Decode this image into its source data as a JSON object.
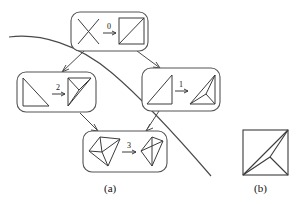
{
  "figure": {
    "caption_a": "(a)",
    "caption_b": "(b)",
    "stroke_color": "#3b3b3b",
    "node_border_color": "#555555",
    "curve_color": "#4a4a4a",
    "background": "#ffffff"
  },
  "panel_a": {
    "name": "flip-graph-tree",
    "nodes": [
      {
        "id": "node-0",
        "label": "0",
        "position": "top",
        "left_shape": "crossing-segments-x",
        "right_shape": "square-with-diagonal",
        "arrow_label": "0"
      },
      {
        "id": "node-2",
        "label": "2",
        "position": "middle-left",
        "left_shape": "triangle-lower-left",
        "right_shape": "triangle-with-interior-point",
        "arrow_label": "2"
      },
      {
        "id": "node-1",
        "label": "1",
        "position": "middle-right",
        "left_shape": "triangle-right",
        "right_shape": "triangle-with-interior-point",
        "arrow_label": "1"
      },
      {
        "id": "node-3",
        "label": "3",
        "position": "bottom",
        "left_shape": "quadrilateral-with-interior-point",
        "right_shape": "quadrilateral-with-both-diagonals",
        "arrow_label": "3"
      }
    ],
    "edges": [
      {
        "from": "node-0",
        "to": "node-2"
      },
      {
        "from": "node-0",
        "to": "node-1"
      },
      {
        "from": "node-2",
        "to": "node-3"
      },
      {
        "from": "node-1",
        "to": "node-3"
      }
    ],
    "overlay_curve": "diagonal-sweep-curve"
  },
  "panel_b": {
    "name": "final-triangulation",
    "shape": "square-with-interior-steiner-point"
  }
}
